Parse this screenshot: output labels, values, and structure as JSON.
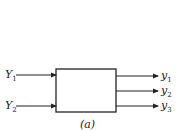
{
  "diagram": {
    "inputs": [
      {
        "symbol": "Y",
        "sub": "1"
      },
      {
        "symbol": "Y",
        "sub": "2"
      }
    ],
    "outputs": [
      {
        "symbol": "y",
        "sub": "1"
      },
      {
        "symbol": "y",
        "sub": "2"
      },
      {
        "symbol": "y",
        "sub": "3"
      }
    ],
    "caption": "(a)"
  }
}
